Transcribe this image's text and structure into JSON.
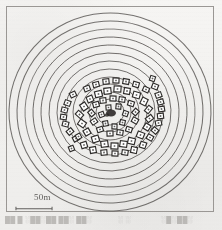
{
  "figure": {
    "kind": "archaeological-site-plan",
    "medium": "scanned-halftone-print",
    "background_color": "#f3f2f0",
    "ink_color": "#3a3836",
    "frame": {
      "x": 6,
      "y": 6,
      "width": 208,
      "height": 206,
      "stroke_color": "#9a9794",
      "stroke_width": 1
    }
  },
  "scale_bar": {
    "label": "50m",
    "bar_x": 15,
    "bar_y": 207,
    "bar_length": 38,
    "tick_height": 5,
    "color": "#4a4845"
  },
  "caption": {
    "note": "caption text is cropped and illegible in the scan",
    "left_fragment": "██  █   ░██░██ ██░ ██░",
    "mid_fragment": "░ ░",
    "right_fragment": "░█░██░"
  },
  "chart_data": {
    "type": "contour-map",
    "title": "",
    "units": "meters",
    "center": {
      "x": 110,
      "y": 112
    },
    "grid": false,
    "legend": "none",
    "contours": {
      "count": 12,
      "description": "concentric oval contour rings, outermost to innermost",
      "stroke_color": "#43403d",
      "rings": [
        {
          "index": 1,
          "rx": 101,
          "ry": 99,
          "cx": 110,
          "cy": 112,
          "rot": -4
        },
        {
          "index": 2,
          "rx": 93,
          "ry": 91,
          "cx": 110,
          "cy": 112,
          "rot": -4
        },
        {
          "index": 3,
          "rx": 85,
          "ry": 83,
          "cx": 110,
          "cy": 112,
          "rot": -3
        },
        {
          "index": 4,
          "rx": 77,
          "ry": 75,
          "cx": 110,
          "cy": 112,
          "rot": -3
        },
        {
          "index": 5,
          "rx": 69,
          "ry": 67,
          "cx": 110,
          "cy": 112,
          "rot": -2
        },
        {
          "index": 6,
          "rx": 61,
          "ry": 59,
          "cx": 110,
          "cy": 112,
          "rot": -2
        },
        {
          "index": 7,
          "rx": 53,
          "ry": 51,
          "cx": 110,
          "cy": 112,
          "rot": -1
        },
        {
          "index": 8,
          "rx": 45,
          "ry": 43,
          "cx": 110,
          "cy": 112,
          "rot": -1
        },
        {
          "index": 9,
          "rx": 37,
          "ry": 35,
          "cx": 110,
          "cy": 112,
          "rot": 0
        },
        {
          "index": 10,
          "rx": 29,
          "ry": 28,
          "cx": 110,
          "cy": 112,
          "rot": 0
        },
        {
          "index": 11,
          "rx": 21,
          "ry": 20,
          "cx": 110,
          "cy": 112,
          "rot": 0
        },
        {
          "index": 12,
          "rx": 14,
          "ry": 13,
          "cx": 110,
          "cy": 112,
          "rot": 0
        }
      ]
    },
    "central_feature": {
      "name": "central-plaza-feature",
      "cx": 111,
      "cy": 113,
      "rx": 5,
      "ry": 3.5,
      "fill": "#2b2927"
    },
    "structures": {
      "count": 72,
      "description": "small rectangular house outlines arranged in concentric rings around the central plaza",
      "stroke_color": "#2e2c2a",
      "fill_color": "#ffffff",
      "items": [
        {
          "x": 104,
          "y": 88,
          "w": 7,
          "h": 6,
          "rot": -6
        },
        {
          "x": 114,
          "y": 86,
          "w": 7,
          "h": 6,
          "rot": 4
        },
        {
          "x": 124,
          "y": 88,
          "w": 6,
          "h": 6,
          "rot": 10
        },
        {
          "x": 133,
          "y": 92,
          "w": 7,
          "h": 6,
          "rot": 16
        },
        {
          "x": 95,
          "y": 91,
          "w": 7,
          "h": 6,
          "rot": -14
        },
        {
          "x": 87,
          "y": 96,
          "w": 6,
          "h": 6,
          "rot": -22
        },
        {
          "x": 141,
          "y": 98,
          "w": 6,
          "h": 7,
          "rot": 26
        },
        {
          "x": 146,
          "y": 106,
          "w": 5,
          "h": 7,
          "rot": 40
        },
        {
          "x": 81,
          "y": 103,
          "w": 6,
          "h": 7,
          "rot": -34
        },
        {
          "x": 77,
          "y": 111,
          "w": 5,
          "h": 7,
          "rot": -48
        },
        {
          "x": 147,
          "y": 115,
          "w": 5,
          "h": 7,
          "rot": 52
        },
        {
          "x": 144,
          "y": 124,
          "w": 6,
          "h": 6,
          "rot": 32
        },
        {
          "x": 79,
          "y": 120,
          "w": 6,
          "h": 7,
          "rot": -56
        },
        {
          "x": 84,
          "y": 129,
          "w": 6,
          "h": 6,
          "rot": -30
        },
        {
          "x": 137,
          "y": 132,
          "w": 7,
          "h": 6,
          "rot": 22
        },
        {
          "x": 128,
          "y": 138,
          "w": 7,
          "h": 6,
          "rot": 14
        },
        {
          "x": 92,
          "y": 136,
          "w": 7,
          "h": 6,
          "rot": -18
        },
        {
          "x": 101,
          "y": 141,
          "w": 7,
          "h": 6,
          "rot": -8
        },
        {
          "x": 111,
          "y": 143,
          "w": 7,
          "h": 6,
          "rot": 2
        },
        {
          "x": 120,
          "y": 141,
          "w": 7,
          "h": 6,
          "rot": 8
        },
        {
          "x": 100,
          "y": 98,
          "w": 6,
          "h": 5,
          "rot": -6
        },
        {
          "x": 110,
          "y": 96,
          "w": 6,
          "h": 5,
          "rot": 2
        },
        {
          "x": 119,
          "y": 97,
          "w": 6,
          "h": 5,
          "rot": 8
        },
        {
          "x": 128,
          "y": 101,
          "w": 6,
          "h": 5,
          "rot": 18
        },
        {
          "x": 93,
          "y": 102,
          "w": 6,
          "h": 5,
          "rot": -16
        },
        {
          "x": 89,
          "y": 110,
          "w": 5,
          "h": 6,
          "rot": -40
        },
        {
          "x": 133,
          "y": 109,
          "w": 5,
          "h": 6,
          "rot": 42
        },
        {
          "x": 132,
          "y": 118,
          "w": 6,
          "h": 5,
          "rot": 30
        },
        {
          "x": 91,
          "y": 119,
          "w": 6,
          "h": 5,
          "rot": -34
        },
        {
          "x": 97,
          "y": 127,
          "w": 6,
          "h": 5,
          "rot": -18
        },
        {
          "x": 126,
          "y": 127,
          "w": 6,
          "h": 5,
          "rot": 18
        },
        {
          "x": 107,
          "y": 131,
          "w": 6,
          "h": 5,
          "rot": -2
        },
        {
          "x": 117,
          "y": 130,
          "w": 6,
          "h": 5,
          "rot": 8
        },
        {
          "x": 106,
          "y": 105,
          "w": 5,
          "h": 5,
          "rot": -4
        },
        {
          "x": 116,
          "y": 104,
          "w": 5,
          "h": 5,
          "rot": 6
        },
        {
          "x": 99,
          "y": 112,
          "w": 5,
          "h": 5,
          "rot": -20
        },
        {
          "x": 123,
          "y": 111,
          "w": 5,
          "h": 5,
          "rot": 20
        },
        {
          "x": 103,
          "y": 121,
          "w": 5,
          "h": 5,
          "rot": -10
        },
        {
          "x": 120,
          "y": 120,
          "w": 5,
          "h": 5,
          "rot": 12
        },
        {
          "x": 112,
          "y": 124,
          "w": 5,
          "h": 5,
          "rot": 2
        },
        {
          "x": 152,
          "y": 84,
          "w": 6,
          "h": 5,
          "rot": 22
        },
        {
          "x": 156,
          "y": 92,
          "w": 5,
          "h": 6,
          "rot": 70
        },
        {
          "x": 158,
          "y": 99,
          "w": 5,
          "h": 6,
          "rot": 74
        },
        {
          "x": 159,
          "y": 106,
          "w": 5,
          "h": 6,
          "rot": 80
        },
        {
          "x": 158,
          "y": 113,
          "w": 5,
          "h": 6,
          "rot": 84
        },
        {
          "x": 156,
          "y": 120,
          "w": 5,
          "h": 6,
          "rot": 78
        },
        {
          "x": 152,
          "y": 128,
          "w": 6,
          "h": 5,
          "rot": 40
        },
        {
          "x": 147,
          "y": 135,
          "w": 6,
          "h": 5,
          "rot": 30
        },
        {
          "x": 140,
          "y": 142,
          "w": 6,
          "h": 6,
          "rot": 20
        },
        {
          "x": 131,
          "y": 147,
          "w": 6,
          "h": 6,
          "rot": 12
        },
        {
          "x": 70,
          "y": 92,
          "w": 6,
          "h": 5,
          "rot": -26
        },
        {
          "x": 65,
          "y": 100,
          "w": 5,
          "h": 6,
          "rot": -70
        },
        {
          "x": 62,
          "y": 107,
          "w": 5,
          "h": 6,
          "rot": -76
        },
        {
          "x": 61,
          "y": 114,
          "w": 5,
          "h": 6,
          "rot": -82
        },
        {
          "x": 63,
          "y": 121,
          "w": 5,
          "h": 6,
          "rot": -76
        },
        {
          "x": 67,
          "y": 129,
          "w": 6,
          "h": 5,
          "rot": -40
        },
        {
          "x": 73,
          "y": 136,
          "w": 6,
          "h": 5,
          "rot": -28
        },
        {
          "x": 81,
          "y": 142,
          "w": 6,
          "h": 6,
          "rot": -18
        },
        {
          "x": 90,
          "y": 147,
          "w": 6,
          "h": 6,
          "rot": -10
        },
        {
          "x": 113,
          "y": 78,
          "w": 6,
          "h": 5,
          "rot": 2
        },
        {
          "x": 123,
          "y": 79,
          "w": 6,
          "h": 5,
          "rot": 10
        },
        {
          "x": 133,
          "y": 82,
          "w": 6,
          "h": 5,
          "rot": 16
        },
        {
          "x": 143,
          "y": 87,
          "w": 6,
          "h": 5,
          "rot": 24
        },
        {
          "x": 103,
          "y": 79,
          "w": 6,
          "h": 5,
          "rot": -6
        },
        {
          "x": 93,
          "y": 82,
          "w": 6,
          "h": 5,
          "rot": -14
        },
        {
          "x": 84,
          "y": 86,
          "w": 6,
          "h": 5,
          "rot": -22
        },
        {
          "x": 76,
          "y": 134,
          "w": 5,
          "h": 5,
          "rot": -30
        },
        {
          "x": 101,
          "y": 150,
          "w": 6,
          "h": 5,
          "rot": -6
        },
        {
          "x": 112,
          "y": 151,
          "w": 6,
          "h": 5,
          "rot": 2
        },
        {
          "x": 122,
          "y": 150,
          "w": 6,
          "h": 5,
          "rot": 8
        },
        {
          "x": 150,
          "y": 76,
          "w": 5,
          "h": 5,
          "rot": 18
        },
        {
          "x": 69,
          "y": 146,
          "w": 5,
          "h": 5,
          "rot": -22
        }
      ]
    }
  }
}
